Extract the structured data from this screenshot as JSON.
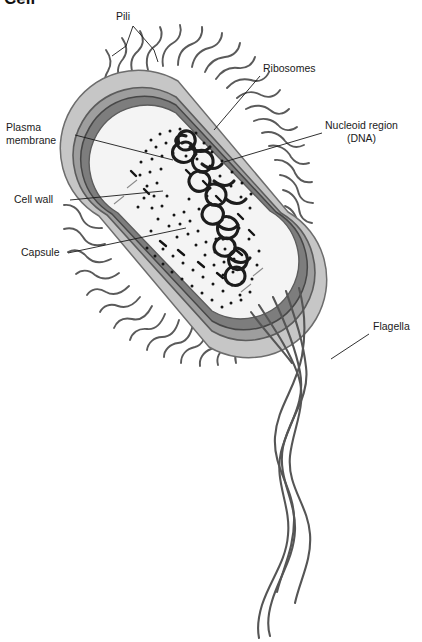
{
  "figure": {
    "title": "Cell",
    "kind": "prokaryotic-bacterial-cell-cross-section",
    "background_color": "#ffffff",
    "ink_color": "#4a4a4a",
    "text_color": "#1a1a1a"
  },
  "labels": {
    "pili": "Pili",
    "ribosomes": "Ribosomes",
    "nucleoid_line1": "Nucleoid region",
    "nucleoid_line2": "(DNA)",
    "plasma_membrane_line1": "Plasma",
    "plasma_membrane_line2": "membrane",
    "cell_wall": "Cell wall",
    "capsule": "Capsule",
    "flagella": "Flagella"
  },
  "structures": {
    "capsule": {
      "name": "Capsule",
      "fill": "#c6c6c6",
      "stroke": "#6a6a6a"
    },
    "cell_wall": {
      "name": "Cell wall",
      "fill": "#9e9e9e",
      "stroke": "#5c5c5c"
    },
    "plasma_membrane": {
      "name": "Plasma membrane",
      "fill": "#7d7d7d",
      "stroke": "#4a4a4a"
    },
    "cytoplasm": {
      "name": "Cytoplasm",
      "fill": "#f4f4f4",
      "stroke": "#5c5c5c"
    },
    "nucleoid": {
      "name": "Nucleoid region (DNA)",
      "stroke": "#1c1c1c"
    },
    "ribosomes": {
      "name": "Ribosomes",
      "fill": "#141414",
      "count": 118
    },
    "pili": {
      "name": "Pili",
      "stroke": "#5a5a5a",
      "count": 38
    },
    "flagella": {
      "name": "Flagella",
      "stroke": "#555555",
      "count": 4
    }
  }
}
